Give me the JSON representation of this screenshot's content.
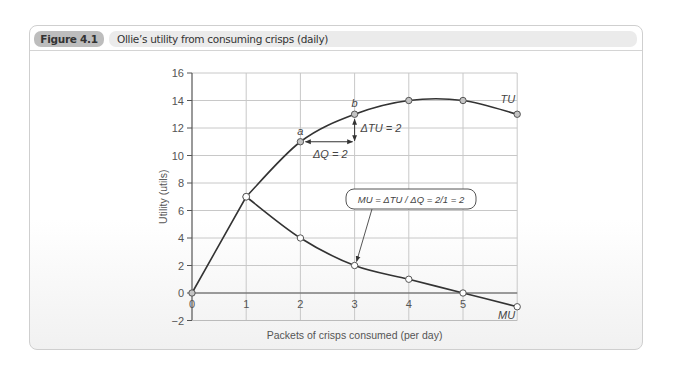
{
  "figure": {
    "label": "Figure 4.1",
    "title": "Ollie’s utility from consuming crisps (daily)"
  },
  "chart_data": {
    "type": "line",
    "title": "Ollie’s utility from consuming crisps (daily)",
    "xlabel": "Packets of crisps consumed (per day)",
    "ylabel": "Utility (utils)",
    "x_ticks": [
      "0",
      "1",
      "2",
      "3",
      "4",
      "5"
    ],
    "y_ticks": [
      "−2",
      "0",
      "2",
      "4",
      "6",
      "8",
      "10",
      "12",
      "14",
      "16"
    ],
    "xlim": [
      0,
      6
    ],
    "ylim": [
      -2,
      16
    ],
    "grid": true,
    "series": [
      {
        "name": "TU",
        "x": [
          0,
          1,
          2,
          3,
          4,
          5,
          6
        ],
        "values": [
          0,
          7,
          11,
          13,
          14,
          14,
          13
        ]
      },
      {
        "name": "MU",
        "x": [
          1,
          2,
          3,
          4,
          5,
          6
        ],
        "values": [
          7,
          4,
          2,
          1,
          0,
          -1
        ]
      }
    ],
    "annotations": {
      "point_a": "a",
      "point_b": "b",
      "delta_q": "ΔQ = 2",
      "delta_tu": "ΔTU = 2",
      "callout": "MU = ΔTU / ΔQ = 2/1 = 2",
      "tu_label": "TU",
      "mu_label": "MU"
    }
  }
}
